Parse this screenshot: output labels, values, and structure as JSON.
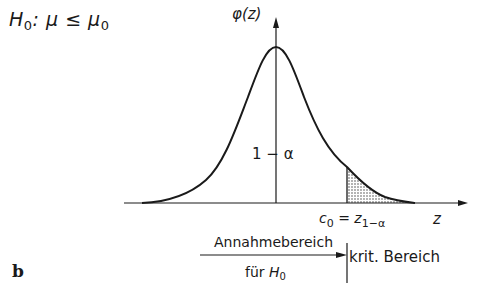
{
  "hypothesis": {
    "text_prefix": "H",
    "subscript": "0",
    "relation": ": μ ≤ μ",
    "subscript2": "0"
  },
  "axes": {
    "y_label": "φ(z)",
    "x_label": "z"
  },
  "curve": {
    "type": "standard normal density",
    "peak_label_region": "1 − α",
    "shaded_region": "right tail beyond c₀ (α)"
  },
  "critical_value": {
    "c": "c",
    "c_sub": "0",
    "eq": " = z",
    "z_sub": "1−α"
  },
  "regions": {
    "acceptance_line1": "Annahmebereich",
    "acceptance_line2_prefix": "für ",
    "acceptance_line2_H": "H",
    "acceptance_line2_sub": "0",
    "critical": "krit. Bereich"
  },
  "panel_label": "b",
  "colors": {
    "ink": "#1a1a1a",
    "shade": "#bdbdbd"
  }
}
